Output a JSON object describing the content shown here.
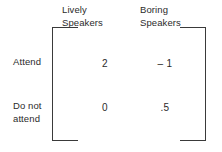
{
  "figure": {
    "type": "payoff-matrix",
    "rows": 2,
    "columns": 2,
    "text_color": "#2b2b2b",
    "bracket_color": "#3a3a3a",
    "background_color": "#ffffff"
  },
  "column_headers": [
    {
      "label": "Lively\nSpeakers"
    },
    {
      "label": "Boring\nSpeakers"
    }
  ],
  "row_labels": [
    {
      "label": "Attend"
    },
    {
      "label": "Do not\nattend"
    }
  ],
  "matrix": {
    "cells": [
      [
        "2",
        "– 1"
      ],
      [
        "0",
        ".5"
      ]
    ]
  },
  "chart_data": {
    "type": "table",
    "title": "",
    "categories": [
      "Lively Speakers",
      "Boring Speakers"
    ],
    "row_categories": [
      "Attend",
      "Do not attend"
    ],
    "values": [
      [
        2,
        -1
      ],
      [
        0,
        0.5
      ]
    ],
    "xlabel": "",
    "ylabel": ""
  }
}
